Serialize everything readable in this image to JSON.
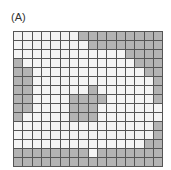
{
  "panel_label": "(A)",
  "grid": {
    "columns": 16,
    "rows": 15,
    "colors": {
      "filled": "#b3b3b3",
      "empty": "#f4f4f4",
      "line": "#555555"
    },
    "cells": [
      [
        0,
        0,
        0,
        0,
        0,
        0,
        0,
        1,
        1,
        1,
        1,
        1,
        1,
        1,
        1,
        1
      ],
      [
        0,
        0,
        0,
        0,
        0,
        0,
        0,
        0,
        1,
        1,
        1,
        1,
        1,
        1,
        1,
        1
      ],
      [
        0,
        0,
        0,
        0,
        0,
        0,
        0,
        0,
        0,
        0,
        0,
        0,
        1,
        1,
        1,
        1
      ],
      [
        1,
        0,
        0,
        0,
        0,
        0,
        0,
        0,
        0,
        0,
        0,
        0,
        0,
        1,
        1,
        1
      ],
      [
        1,
        1,
        0,
        0,
        0,
        0,
        0,
        0,
        0,
        0,
        0,
        0,
        0,
        0,
        1,
        1
      ],
      [
        1,
        1,
        0,
        0,
        0,
        0,
        0,
        0,
        0,
        0,
        0,
        0,
        0,
        0,
        0,
        1
      ],
      [
        1,
        1,
        0,
        0,
        0,
        0,
        0,
        0,
        1,
        0,
        0,
        0,
        0,
        0,
        0,
        1
      ],
      [
        1,
        1,
        0,
        0,
        0,
        0,
        1,
        1,
        1,
        1,
        0,
        0,
        0,
        0,
        0,
        1
      ],
      [
        1,
        1,
        0,
        0,
        0,
        0,
        1,
        1,
        1,
        0,
        0,
        0,
        0,
        0,
        0,
        0
      ],
      [
        1,
        0,
        0,
        0,
        0,
        0,
        1,
        1,
        1,
        0,
        0,
        0,
        0,
        0,
        0,
        0
      ],
      [
        0,
        0,
        0,
        0,
        0,
        0,
        0,
        0,
        0,
        0,
        0,
        0,
        0,
        0,
        0,
        1
      ],
      [
        0,
        0,
        0,
        0,
        0,
        0,
        0,
        0,
        0,
        0,
        0,
        0,
        0,
        0,
        0,
        1
      ],
      [
        0,
        0,
        0,
        0,
        0,
        0,
        0,
        0,
        0,
        0,
        0,
        0,
        0,
        0,
        1,
        1
      ],
      [
        1,
        1,
        1,
        1,
        1,
        1,
        1,
        1,
        0,
        1,
        1,
        1,
        1,
        1,
        1,
        1
      ],
      [
        1,
        1,
        1,
        1,
        1,
        1,
        1,
        1,
        1,
        1,
        1,
        1,
        1,
        1,
        1,
        1
      ]
    ]
  }
}
